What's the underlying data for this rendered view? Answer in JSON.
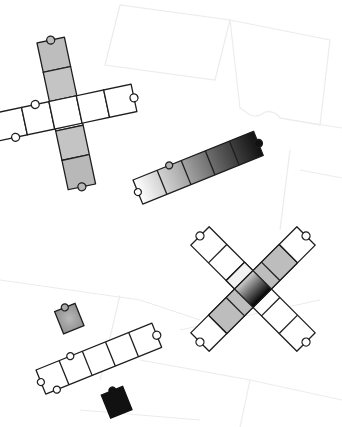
{
  "canvas": {
    "width": 342,
    "height": 427,
    "background": "#ffffff"
  },
  "colors": {
    "outline": "#1e1e1e",
    "faint_outline": "#ececec",
    "white": "#ffffff",
    "light_gray": "#bdbdbd",
    "mid_gray": "#a8a8a8",
    "dark": "#111111"
  },
  "groups": [
    {
      "name": "vertical-bar-cross",
      "description": "Cross of puzzle pieces, gray vertical column over white horizontal row"
    },
    {
      "name": "gradient-strip",
      "description": "Row of five pieces shading from white to black"
    },
    {
      "name": "x-cross",
      "description": "Diagonal X of pieces with gradient center"
    },
    {
      "name": "single-gray-piece",
      "description": "Lone gray piece"
    },
    {
      "name": "white-strip",
      "description": "Row of five white pieces"
    },
    {
      "name": "single-black-piece",
      "description": "Lone black piece"
    }
  ]
}
